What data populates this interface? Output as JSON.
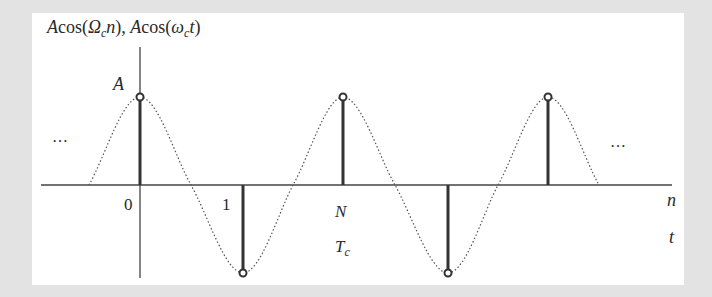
{
  "title": {
    "expr1_A": "A",
    "expr1_cos": "cos(",
    "expr1_Omega": "Ω",
    "expr1_sub": "c",
    "expr1_var": "n",
    "expr1_close": "), ",
    "expr2_A": "A",
    "expr2_cos": "cos(",
    "expr2_omega": "ω",
    "expr2_sub": "c",
    "expr2_var": "t",
    "expr2_close": ")"
  },
  "labels": {
    "amplitude": "A",
    "zero": "0",
    "one": "1",
    "N": "N",
    "Tc_main": "T",
    "Tc_sub": "c",
    "n_axis": "n",
    "t_axis": "t",
    "ellipsis_left": "…",
    "ellipsis_right": "…"
  },
  "colors": {
    "background": "#e3e3e3",
    "canvas": "#ffffff",
    "stroke": "#333333",
    "curve": "#555555"
  },
  "diagram_data": {
    "type": "stem-plot-with-continuous-envelope",
    "samples": [
      {
        "index": "0",
        "value": "A"
      },
      {
        "index": "1",
        "value": "-A"
      },
      {
        "index": "N",
        "value": "A"
      },
      {
        "index": "3",
        "value": "-A"
      },
      {
        "index": "4",
        "value": "A"
      }
    ],
    "envelope": "dotted cosine A·cos(ω_c t)",
    "x_axis_labels": [
      "n",
      "t"
    ],
    "period_label_samples": "N",
    "period_label_time": "T_c"
  }
}
